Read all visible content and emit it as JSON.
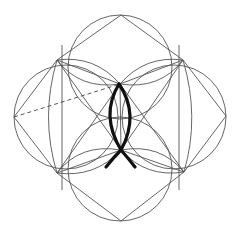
{
  "diagram": {
    "title": "",
    "colors": {
      "background": "#ffffff",
      "thin_line": "#555555",
      "thick_line": "#111111"
    },
    "circles": [
      {
        "name": "top",
        "cx": 120,
        "cy": 67,
        "r": 52
      },
      {
        "name": "bottom",
        "cx": 120,
        "cy": 169,
        "r": 52
      },
      {
        "name": "left",
        "cx": 66,
        "cy": 117,
        "r": 52
      },
      {
        "name": "right",
        "cx": 174,
        "cy": 117,
        "r": 52
      }
    ],
    "vertices": {
      "top": [
        121,
        15
      ],
      "upper_left": [
        57,
        60
      ],
      "upper_right": [
        183,
        60
      ],
      "left": [
        14,
        117
      ],
      "right": [
        226,
        116
      ],
      "lower_left": [
        57,
        173
      ],
      "lower_right": [
        184,
        172
      ],
      "bottom": [
        121,
        221
      ],
      "inner_top": [
        120,
        84
      ],
      "inner_bottom": [
        121,
        150
      ]
    }
  }
}
